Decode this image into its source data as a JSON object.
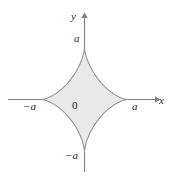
{
  "figure": {
    "kind": "astroid-plot",
    "background_color": "#ffffff",
    "axis_color": "#808285",
    "curve_stroke_color": "#939598",
    "curve_fill_color": "#e9e9ea",
    "text_color": "#231f20"
  },
  "axes": {
    "x_axis_label": "x",
    "y_axis_label": "y",
    "origin_label": "0",
    "origin_x": 84,
    "origin_y": 99,
    "x_axis_start_x": 8,
    "x_axis_end_x": 160,
    "y_axis_top_y": 14,
    "y_axis_bottom_y": 172
  },
  "ticks": {
    "x_positive": "a",
    "x_negative": "−a",
    "y_positive": "a",
    "y_negative": "−a"
  },
  "chart_data": {
    "type": "line",
    "title": "",
    "subtitle": "",
    "xlabel": "x",
    "ylabel": "y",
    "curve_name": "astroid",
    "equation": "x^(2/3) + y^(2/3) = a^(2/3)",
    "parametric": "x = a cos^3 t,  y = a sin^3 t",
    "exponent": 0.6666666667,
    "semi_axis_a": 1,
    "cusps": [
      {
        "label": "a",
        "x": 1,
        "y": 0
      },
      {
        "label": "a",
        "x": 0,
        "y": 1
      },
      {
        "label": "−a",
        "x": -1,
        "y": 0
      },
      {
        "label": "−a",
        "x": 0,
        "y": -1
      }
    ],
    "pixel_cusps": {
      "left_x": 41,
      "right_x": 128,
      "top_y": 47,
      "bottom_y": 150
    },
    "pixel_radius_x": 43,
    "pixel_radius_y": 52,
    "x_tick_labels": [
      "−a",
      "0",
      "a"
    ],
    "y_tick_labels": [
      "−a",
      "0",
      "a"
    ],
    "xlim": [
      -1.75,
      1.75
    ],
    "ylim": [
      -1.65,
      1.65
    ],
    "grid": false,
    "legend": "none",
    "shaded_region": true,
    "shaded_region_fill": "#e9e9ea"
  }
}
